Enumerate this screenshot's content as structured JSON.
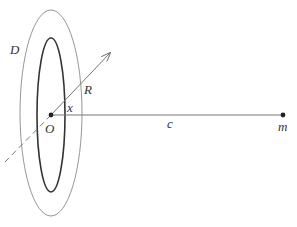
{
  "diagram": {
    "labels": {
      "D": "D",
      "R": "R",
      "x": "x",
      "O": "O",
      "c": "c",
      "m": "m"
    },
    "colors": {
      "outer_ring": "#8a8a8a",
      "inner_ring": "#333333",
      "lines": "#777777",
      "points": "#222222"
    }
  }
}
